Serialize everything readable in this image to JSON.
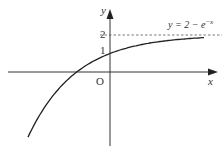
{
  "diagram": {
    "equation_label": "y = 2 − e",
    "equation_exp": "−x",
    "y_axis_label": "y",
    "x_axis_label": "x",
    "origin_label": "O",
    "tick_2": "2",
    "tick_1": "1",
    "asymptote": "y = 2",
    "colors": {
      "curve": "#222222",
      "axis": "#333333",
      "dash": "#555555"
    }
  }
}
